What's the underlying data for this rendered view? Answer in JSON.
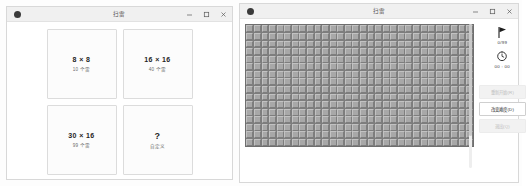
{
  "windows": {
    "difficulty": {
      "title": "扫雷",
      "app_icon": "app-dot-icon",
      "controls": {
        "minimize": "minimize-icon",
        "maximize": "maximize-icon",
        "close": "close-icon"
      },
      "cards": [
        {
          "title": "8 × 8",
          "subtitle": "10 个雷",
          "name": "preset-beginner"
        },
        {
          "title": "16 × 16",
          "subtitle": "40 个雷",
          "name": "preset-intermediate"
        },
        {
          "title": "30 × 16",
          "subtitle": "99 个雷",
          "name": "preset-expert"
        },
        {
          "title": "?",
          "subtitle": "自定义",
          "name": "preset-custom"
        }
      ]
    },
    "game": {
      "title": "扫雷",
      "app_icon": "app-dot-icon",
      "controls": {
        "minimize": "minimize-icon",
        "maximize": "maximize-icon",
        "close": "close-icon"
      },
      "stats": {
        "flag_icon": "flag-icon",
        "flag_count": "0/99",
        "timer_icon": "clock-icon",
        "timer": "00 : 00"
      },
      "buttons": [
        {
          "label": "重新开始(R)",
          "state": "disabled",
          "name": "restart-button"
        },
        {
          "label": "改变难度(D)",
          "state": "active",
          "name": "change-difficulty-button"
        },
        {
          "label": "退出(Q)",
          "state": "disabled",
          "name": "quit-button"
        }
      ],
      "board": {
        "columns": 30,
        "rows": 16,
        "mines": 99,
        "cell_state": "covered"
      }
    }
  },
  "colors": {
    "cell_face": "#a8a8a8",
    "cell_gap": "#7d7d7d",
    "window_chrome": "#f0f0f0",
    "card_border": "#dcdcdc",
    "text_primary": "#242424",
    "text_secondary": "#6c6c6c"
  }
}
